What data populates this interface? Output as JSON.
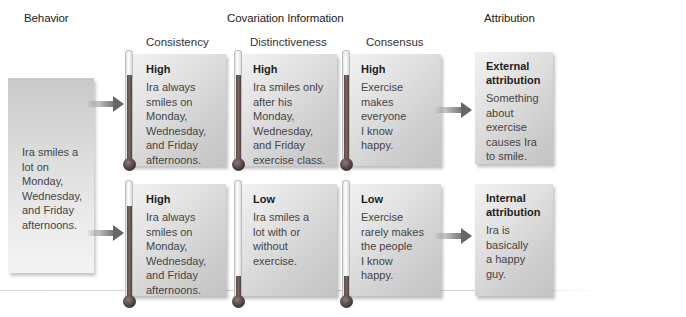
{
  "headers": {
    "behavior": "Behavior",
    "covariation": "Covariation Information",
    "attribution": "Attribution"
  },
  "columns": {
    "consistency": "Consistency",
    "distinctiveness": "Distinctiveness",
    "consensus": "Consensus"
  },
  "behavior_box": {
    "text_lines": [
      "Ira smiles a",
      "lot on",
      "Monday,",
      "Wednesday,",
      "and Friday",
      "afternoons."
    ]
  },
  "rows": [
    {
      "consistency": {
        "level": "High",
        "lines": [
          "Ira always",
          "smiles on",
          "Monday,",
          "Wednesday,",
          "and Friday",
          "afternoons."
        ],
        "fill_pct": 85
      },
      "distinctiveness": {
        "level": "High",
        "lines": [
          "Ira smiles only",
          "after his",
          "Monday,",
          "Wednesday,",
          "and Friday",
          "exercise class."
        ],
        "fill_pct": 85
      },
      "consensus": {
        "level": "High",
        "lines": [
          "Exercise",
          "makes",
          "everyone",
          "I know",
          "happy."
        ],
        "fill_pct": 85
      },
      "attribution": {
        "title_lines": [
          "External",
          "attribution"
        ],
        "lines": [
          "Something",
          "about",
          "exercise",
          "causes Ira",
          "to smile."
        ]
      }
    },
    {
      "consistency": {
        "level": "High",
        "lines": [
          "Ira always",
          "smiles on",
          "Monday,",
          "Wednesday,",
          "and Friday",
          "afternoons."
        ],
        "fill_pct": 85
      },
      "distinctiveness": {
        "level": "Low",
        "lines": [
          "Ira smiles a",
          "lot with or",
          "without",
          "exercise."
        ],
        "fill_pct": 22
      },
      "consensus": {
        "level": "Low",
        "lines": [
          "Exercise",
          "rarely makes",
          "the people",
          "I know",
          "happy."
        ],
        "fill_pct": 22
      },
      "attribution": {
        "title_lines": [
          "Internal",
          "attribution"
        ],
        "lines": [
          "Ira is",
          "basically",
          "a happy",
          "guy."
        ]
      }
    }
  ],
  "colors": {
    "thermometer_fill": "#6b5856",
    "arrow": "#6b6b6b",
    "card_light": "#f2f2f2",
    "card_dark": "#c4c4c4"
  }
}
